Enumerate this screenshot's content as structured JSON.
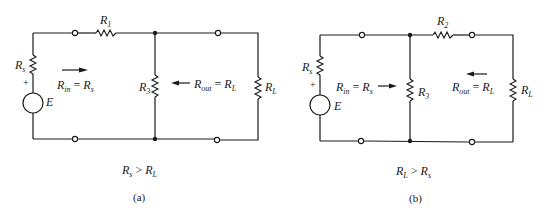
{
  "figures": [
    {
      "id": "a",
      "caption": "(a)",
      "condition": {
        "left": "R",
        "left_sub": "s",
        "op": ">",
        "right": "R",
        "right_sub": "L"
      },
      "labels": {
        "series_resistor": {
          "main": "R",
          "sub": "1"
        },
        "shunt_resistor": {
          "main": "R",
          "sub": "3"
        },
        "source_resistor": {
          "main": "R",
          "sub": "s"
        },
        "load_resistor": {
          "main": "R",
          "sub": "L"
        },
        "source": "E",
        "polarity": "+",
        "rin": {
          "main": "R",
          "sub": "in",
          "eq": "= ",
          "rhs": "R",
          "rhs_sub": "s"
        },
        "rout": {
          "main": "R",
          "sub": "out",
          "eq": "= ",
          "rhs": "R",
          "rhs_sub": "L"
        }
      }
    },
    {
      "id": "b",
      "caption": "(b)",
      "condition": {
        "left": "R",
        "left_sub": "L",
        "op": ">",
        "right": "R",
        "right_sub": "s"
      },
      "labels": {
        "series_resistor": {
          "main": "R",
          "sub": "2"
        },
        "shunt_resistor": {
          "main": "R",
          "sub": "3"
        },
        "source_resistor": {
          "main": "R",
          "sub": "s"
        },
        "load_resistor": {
          "main": "R",
          "sub": "L"
        },
        "source": "E",
        "polarity": "+",
        "rin": {
          "main": "R",
          "sub": "in",
          "eq": "= ",
          "rhs": "R",
          "rhs_sub": "s"
        },
        "rout": {
          "main": "R",
          "sub": "out",
          "eq": "= ",
          "rhs": "R",
          "rhs_sub": "L"
        }
      }
    }
  ]
}
